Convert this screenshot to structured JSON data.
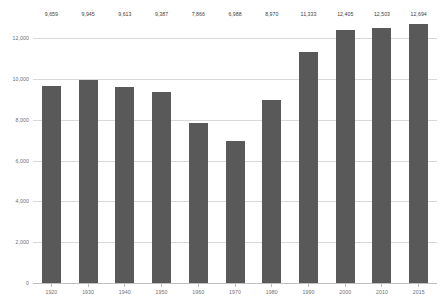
{
  "chart_data": {
    "type": "bar",
    "title": "",
    "subtitle": "",
    "xlabel": "",
    "ylabel": "",
    "categories": [
      "1920",
      "1930",
      "1940",
      "1950",
      "1960",
      "1970",
      "1980",
      "1990",
      "2000",
      "2010",
      "2015"
    ],
    "values": [
      9659,
      9945,
      9613,
      9387,
      7866,
      6988,
      8970,
      11333,
      12405,
      12503,
      12694
    ],
    "value_labels": [
      "9,659",
      "9,945",
      "9,613",
      "9,387",
      "7,866",
      "6,988",
      "8,970",
      "11,333",
      "12,405",
      "12,503",
      "12,694"
    ],
    "ylim": [
      0,
      13000
    ],
    "yticks": [
      0,
      2000,
      4000,
      6000,
      8000,
      10000,
      12000
    ],
    "ytick_labels": [
      "0",
      "2,000",
      "4,000",
      "6,000",
      "8,000",
      "10,000",
      "12,000"
    ],
    "grid": true,
    "legend": "none",
    "legend_position": "none",
    "bar_color": "#595959",
    "gridline_color": "#d9d9d9",
    "axis_color": "#bfbfbf",
    "label_color": "#404040",
    "tick_color": "#6e6e6e",
    "background": "#ffffff"
  }
}
